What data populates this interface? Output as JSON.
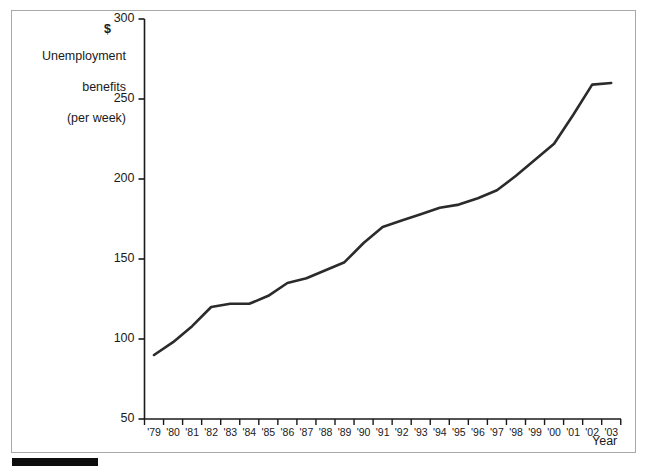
{
  "chart_data": {
    "type": "line",
    "title": "",
    "ylabel": "Unemployment benefits (per week)",
    "ylabel_lines": [
      "Unemployment",
      "benefits",
      "(per week)"
    ],
    "currency_symbol": "$",
    "xlabel": "Year",
    "ylim": [
      50,
      300
    ],
    "ytick_values": [
      50,
      100,
      150,
      200,
      250,
      300
    ],
    "ytick_labels": [
      "50",
      "100",
      "150",
      "200",
      "250",
      "300"
    ],
    "grid": false,
    "legend": null,
    "categories": [
      "'79",
      "'80",
      "'81",
      "'82",
      "'83",
      "'84",
      "'85",
      "'86",
      "'87",
      "'88",
      "'89",
      "'90",
      "'91",
      "'92",
      "'93",
      "'94",
      "'95",
      "'96",
      "'97",
      "'98",
      "'99",
      "'00",
      "'01",
      "'02",
      "'03"
    ],
    "x": [
      1979,
      1980,
      1981,
      1982,
      1983,
      1984,
      1985,
      1986,
      1987,
      1988,
      1989,
      1990,
      1991,
      1992,
      1993,
      1994,
      1995,
      1996,
      1997,
      1998,
      1999,
      2000,
      2001,
      2002,
      2003
    ],
    "values": [
      90,
      98,
      108,
      120,
      122,
      122,
      127,
      135,
      138,
      143,
      148,
      160,
      170,
      174,
      178,
      182,
      184,
      188,
      193,
      202,
      212,
      222,
      240,
      259,
      260
    ],
    "series": [
      {
        "name": "Unemployment benefits (per week)",
        "color": "#2b2b2b",
        "values": [
          90,
          98,
          108,
          120,
          122,
          122,
          127,
          135,
          138,
          143,
          148,
          160,
          170,
          174,
          178,
          182,
          184,
          188,
          193,
          202,
          212,
          222,
          240,
          259,
          260
        ]
      }
    ]
  },
  "figure": {
    "border_color": "#a8a8a8",
    "background": "#ffffff",
    "axis_color": "#1a1a1a",
    "line_color": "#2b2b2b"
  },
  "caption_bar": {
    "name": "redacted-caption-bar",
    "color": "#0d0d0d"
  }
}
